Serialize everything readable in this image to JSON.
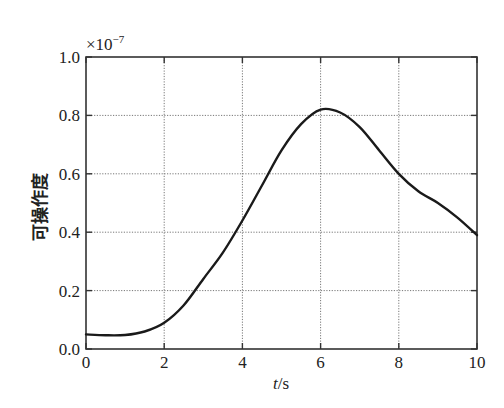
{
  "chart_data": {
    "type": "line",
    "title": "",
    "xlabel": "t/s",
    "ylabel": "可操作度",
    "y_multiplier": "×10⁻⁷",
    "xlim": [
      0,
      10
    ],
    "ylim": [
      0,
      1.0
    ],
    "x_ticks": [
      "0",
      "2",
      "4",
      "6",
      "8",
      "10"
    ],
    "y_ticks": [
      "0.0",
      "0.2",
      "0.4",
      "0.6",
      "0.8",
      "1.0"
    ],
    "grid": true,
    "legend": null,
    "series": [
      {
        "name": "manipulability",
        "color": "#1a1a1a",
        "x": [
          0,
          0.5,
          1,
          1.5,
          2,
          2.5,
          3,
          3.5,
          4,
          4.5,
          5,
          5.5,
          6,
          6.5,
          7,
          7.5,
          8,
          8.5,
          9,
          9.5,
          10
        ],
        "y": [
          0.05,
          0.047,
          0.048,
          0.06,
          0.09,
          0.15,
          0.24,
          0.33,
          0.44,
          0.56,
          0.68,
          0.77,
          0.82,
          0.81,
          0.76,
          0.68,
          0.6,
          0.54,
          0.5,
          0.45,
          0.39
        ]
      }
    ]
  },
  "labels": {
    "x_axis_italic": "t",
    "x_axis_unit": "/s",
    "y_axis": "可操作度",
    "multiplier_base": "×10",
    "multiplier_exp": "−7"
  }
}
